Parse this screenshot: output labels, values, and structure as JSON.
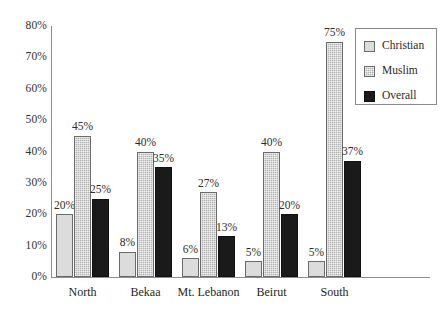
{
  "chart_data": {
    "type": "bar",
    "title": "",
    "subtitle": "",
    "xlabel": "",
    "ylabel": "",
    "categories": [
      "North",
      "Bekaa",
      "Mt. Lebanon",
      "Beirut",
      "South"
    ],
    "series": [
      {
        "name": "Christian",
        "color": "#dcdcdc",
        "values": [
          20,
          8,
          6,
          5,
          5
        ],
        "labels": [
          "20%",
          "8%",
          "6%",
          "5%",
          "5%"
        ]
      },
      {
        "name": "Muslim",
        "color": "#b4b4b4",
        "values": [
          45,
          40,
          27,
          40,
          75
        ],
        "labels": [
          "45%",
          "40%",
          "27%",
          "40%",
          "75%"
        ]
      },
      {
        "name": "Overall",
        "color": "#1a1a1a",
        "values": [
          25,
          35,
          13,
          20,
          37
        ],
        "labels": [
          "25%",
          "35%",
          "13%",
          "20%",
          "37%"
        ]
      }
    ],
    "ylim": [
      0,
      80
    ],
    "ytick_values": [
      80,
      70,
      60,
      50,
      40,
      30,
      20,
      10,
      0
    ],
    "ytick_labels": [
      "80%",
      "70%",
      "60%",
      "50%",
      "40%",
      "30%",
      "20%",
      "10%",
      "0%"
    ],
    "grid": false,
    "legend_position": "top-right",
    "legend_entries": [
      "Christian",
      "Muslim",
      "Overall"
    ],
    "value_labels_shown": true,
    "background_color": "#ffffff",
    "axis_color": "#8d8d8d"
  }
}
